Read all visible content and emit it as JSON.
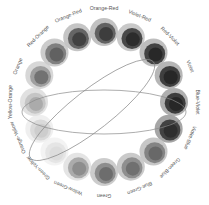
{
  "diagram": {
    "center": [
      104,
      102
    ],
    "ring_radius": 70,
    "label_radius": 93,
    "segments": [
      {
        "label": "Orange-Red",
        "angle": -90,
        "outer": "#bdbdbd",
        "mid": "#5a5a5a",
        "inner": "#3a3a3a"
      },
      {
        "label": "Violet-Red",
        "angle": -67.5,
        "outer": "#c4c4c4",
        "mid": "#3e3e3e",
        "inner": "#2a2a2a"
      },
      {
        "label": "Red-Violet",
        "angle": -45,
        "outer": "#b8b8b8",
        "mid": "#3a3a3a",
        "inner": "#262626"
      },
      {
        "label": "Violet",
        "angle": -22.5,
        "outer": "#b0b0b0",
        "mid": "#353535",
        "inner": "#252525"
      },
      {
        "label": "Blue-Violet",
        "angle": 0,
        "outer": "#a8a8a8",
        "mid": "#333333",
        "inner": "#252525"
      },
      {
        "label": "Violet-Blue",
        "angle": 22.5,
        "outer": "#9e9e9e",
        "mid": "#3a3a3a",
        "inner": "#2c2c2c"
      },
      {
        "label": "Green-Blue",
        "angle": 45,
        "outer": "#c2c2c2",
        "mid": "#7e7e7e",
        "inner": "#666666"
      },
      {
        "label": "Blue-Green",
        "angle": 67.5,
        "outer": "#c6c6c6",
        "mid": "#8a8a8a",
        "inner": "#6e6e6e"
      },
      {
        "label": "Green",
        "angle": 90,
        "outer": "#c8c8c8",
        "mid": "#888888",
        "inner": "#6a6a6a"
      },
      {
        "label": "Yellow-Green",
        "angle": 112.5,
        "outer": "#e2e2e2",
        "mid": "#a6a6a6",
        "inner": "#8a8a8a"
      },
      {
        "label": "Green-Yellow",
        "angle": 135,
        "outer": "#f2f2f2",
        "mid": "#e4e4e4",
        "inner": "#dcdcdc"
      },
      {
        "label": "Orange-Yellow",
        "angle": 157.5,
        "outer": "#eeeeee",
        "mid": "#d8d8d8",
        "inner": "#cccccc"
      },
      {
        "label": "Yellow-Orange",
        "angle": 180,
        "outer": "#dedede",
        "mid": "#c2c2c2",
        "inner": "#a8a8a8"
      },
      {
        "label": "Orange",
        "angle": -157.5,
        "outer": "#d4d4d4",
        "mid": "#9a9a9a",
        "inner": "#6e6e6e"
      },
      {
        "label": "Red-Orange",
        "angle": -135,
        "outer": "#c8c8c8",
        "mid": "#7a7a7a",
        "inner": "#5e5e5e"
      },
      {
        "label": "Orange-Red",
        "angle": -112.5,
        "outer": "#c0c0c0",
        "mid": "#5c5c5c",
        "inner": "#3e3e3e"
      }
    ],
    "ellipses": [
      {
        "cx": 104,
        "cy": 112,
        "rx": 82,
        "ry": 22,
        "rotate": 0,
        "stroke": "#8a8a8a"
      },
      {
        "cx": 92,
        "cy": 110,
        "rx": 78,
        "ry": 20,
        "rotate": -38,
        "stroke": "#8a8a8a"
      }
    ]
  }
}
